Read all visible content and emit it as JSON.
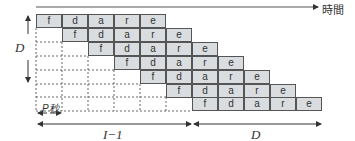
{
  "diagram": {
    "time_axis_label": "時間",
    "vertical_label": "D",
    "period_label": "P秒",
    "bottom_left_label": "I−1",
    "bottom_right_label": "D",
    "stages": [
      "f",
      "d",
      "a",
      "r",
      "e"
    ],
    "rows": 7,
    "row_offsets": [
      0,
      1,
      2,
      3,
      4,
      5,
      6
    ],
    "colors": {
      "cell_fill": "#d9dde0",
      "border": "#555555",
      "line": "#333333"
    }
  }
}
